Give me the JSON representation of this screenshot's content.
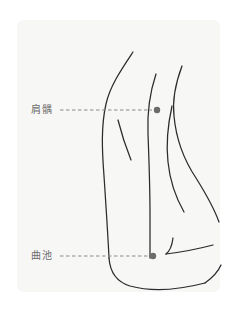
{
  "figure": {
    "orientation": "lateral view of right shoulder, upper arm and elbow",
    "background_color": "#ffffff",
    "panel_color": "#f7f7f6",
    "line_color": "#2b2b2b",
    "marker_color": "#6b6b6b",
    "label_color": "#6d6d6d",
    "caption_partial": ""
  },
  "annotations": [
    {
      "id": "jianyu",
      "label": "肩髃",
      "romanization": "Jianyu",
      "code": "LI15",
      "label_x": 31,
      "label_y": 104,
      "leader_start_x": 60,
      "leader_end_x": 152,
      "leader_y": 110,
      "marker_x": 157,
      "marker_y": 110,
      "marker_radius": 3.2,
      "region": "shoulder"
    },
    {
      "id": "quchi",
      "label": "曲池",
      "romanization": "Quchi",
      "code": "LI11",
      "label_x": 31,
      "label_y": 250,
      "leader_start_x": 60,
      "leader_end_x": 148,
      "leader_y": 256,
      "marker_x": 153,
      "marker_y": 256,
      "marker_radius": 3.2,
      "region": "elbow crease"
    }
  ],
  "panel": {
    "x": 17,
    "y": 20,
    "width": 203,
    "height": 272,
    "corner_radius": 7
  },
  "strokes": {
    "shoulder_upper_arm": "M133,52 C121,70 110,86 106,104 C101,126 102,150 104,176 C106,206 108,236 109,258",
    "deltoid_crease": "M118,120 C122,136 127,150 131,160",
    "forearm_outer": "M109,258 C110,272 117,282 130,286 C152,292 178,290 205,283",
    "flank_front": "M156,74 C150,92 147,112 148,134 C149,160 150,190 150,214 C150,232 150,248 150,258",
    "back_contour": "M182,66 C176,82 172,98 174,116 C176,138 184,160 196,178 C206,194 214,208 219,222",
    "torso_inner": "M172,106 C168,124 166,144 168,162 C170,182 176,198 184,212",
    "elbow_joint": "M173,240 C172,248 170,252 166,254",
    "forearm_upper": "M166,254 C182,252 198,248 213,244",
    "wrist_edge": "M205,283 C212,278 218,272 221,266"
  }
}
